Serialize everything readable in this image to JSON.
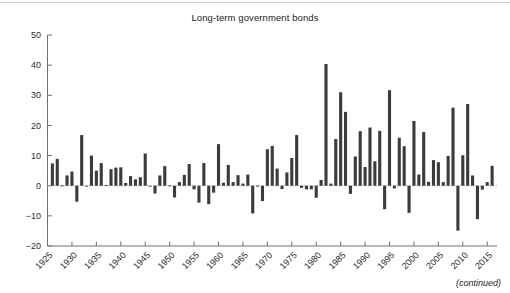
{
  "figure": {
    "title": "Long-term government bonds",
    "footnote": "(continued)",
    "bar_color": "#3b3b3b",
    "axis_color": "#6f6f6f"
  },
  "chart_data": {
    "type": "bar",
    "title": "Long-term government bonds",
    "xlabel": "",
    "ylabel": "",
    "ylim": [
      -20,
      50
    ],
    "xlim": [
      1925,
      2017
    ],
    "grid": false,
    "legend": "none",
    "yticks": [
      -20,
      -10,
      0,
      10,
      20,
      30,
      40,
      50
    ],
    "ytick_labels": [
      "−20",
      "−10",
      "0",
      "10",
      "20",
      "30",
      "40",
      "50"
    ],
    "xticks": [
      1925,
      1930,
      1935,
      1940,
      1945,
      1950,
      1955,
      1960,
      1965,
      1970,
      1975,
      1980,
      1985,
      1990,
      1995,
      2000,
      2005,
      2010,
      2015
    ],
    "xtick_labels": [
      "1925",
      "1930",
      "1935",
      "1940",
      "1945",
      "1950",
      "1955",
      "1960",
      "1965",
      "1970",
      "1975",
      "1980",
      "1985",
      "1990",
      "1995",
      "2000",
      "2005",
      "2010",
      "2015"
    ],
    "annotations": [
      "(continued)"
    ],
    "x": [
      1926,
      1927,
      1928,
      1929,
      1930,
      1931,
      1932,
      1933,
      1934,
      1935,
      1936,
      1937,
      1938,
      1939,
      1940,
      1941,
      1942,
      1943,
      1944,
      1945,
      1946,
      1947,
      1948,
      1949,
      1950,
      1951,
      1952,
      1953,
      1954,
      1955,
      1956,
      1957,
      1958,
      1959,
      1960,
      1961,
      1962,
      1963,
      1964,
      1965,
      1966,
      1967,
      1968,
      1969,
      1970,
      1971,
      1972,
      1973,
      1974,
      1975,
      1976,
      1977,
      1978,
      1979,
      1980,
      1981,
      1982,
      1983,
      1984,
      1985,
      1986,
      1987,
      1988,
      1989,
      1990,
      1991,
      1992,
      1993,
      1994,
      1995,
      1996,
      1997,
      1998,
      1999,
      2000,
      2001,
      2002,
      2003,
      2004,
      2005,
      2006,
      2007,
      2008,
      2009,
      2010,
      2011,
      2012,
      2013,
      2014,
      2015,
      2016
    ],
    "categories": [
      "1926",
      "1927",
      "1928",
      "1929",
      "1930",
      "1931",
      "1932",
      "1933",
      "1934",
      "1935",
      "1936",
      "1937",
      "1938",
      "1939",
      "1940",
      "1941",
      "1942",
      "1943",
      "1944",
      "1945",
      "1946",
      "1947",
      "1948",
      "1949",
      "1950",
      "1951",
      "1952",
      "1953",
      "1954",
      "1955",
      "1956",
      "1957",
      "1958",
      "1959",
      "1960",
      "1961",
      "1962",
      "1963",
      "1964",
      "1965",
      "1966",
      "1967",
      "1968",
      "1969",
      "1970",
      "1971",
      "1972",
      "1973",
      "1974",
      "1975",
      "1976",
      "1977",
      "1978",
      "1979",
      "1980",
      "1981",
      "1982",
      "1983",
      "1984",
      "1985",
      "1986",
      "1987",
      "1988",
      "1989",
      "1990",
      "1991",
      "1992",
      "1993",
      "1994",
      "1995",
      "1996",
      "1997",
      "1998",
      "1999",
      "2000",
      "2001",
      "2002",
      "2003",
      "2004",
      "2005",
      "2006",
      "2007",
      "2008",
      "2009",
      "2010",
      "2011",
      "2012",
      "2013",
      "2014",
      "2015",
      "2016"
    ],
    "values": [
      7.4,
      8.9,
      0.1,
      3.4,
      4.7,
      -5.3,
      16.8,
      -0.1,
      10.0,
      5.0,
      7.5,
      0.2,
      5.5,
      6.0,
      6.1,
      0.9,
      3.2,
      2.1,
      2.8,
      10.7,
      -0.1,
      -2.6,
      3.4,
      6.5,
      0.1,
      -3.9,
      1.2,
      3.6,
      7.2,
      -1.2,
      -5.6,
      7.5,
      -6.1,
      -2.3,
      13.8,
      1.0,
      6.9,
      1.2,
      3.5,
      0.7,
      3.7,
      -9.2,
      -0.3,
      -5.1,
      12.1,
      13.2,
      5.7,
      -1.1,
      4.4,
      9.2,
      16.8,
      -0.7,
      -1.2,
      -1.2,
      -4.0,
      1.9,
      40.4,
      0.7,
      15.5,
      31.0,
      24.5,
      -2.7,
      9.7,
      18.1,
      6.2,
      19.3,
      8.1,
      18.2,
      -7.8,
      31.7,
      -0.9,
      15.9,
      13.1,
      -9.0,
      21.5,
      3.7,
      17.8,
      1.3,
      8.5,
      7.8,
      1.2,
      9.9,
      25.9,
      -14.9,
      10.1,
      27.1,
      3.4,
      -11.1,
      -1.3,
      1.2,
      6.6
    ]
  }
}
